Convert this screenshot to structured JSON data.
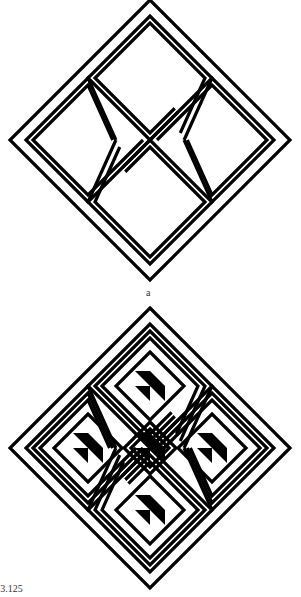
{
  "figure": {
    "panel_a_label": "a",
    "caption": "re 3.125",
    "panels": [
      {
        "id": "a",
        "motif": "diamond-with-four-hooked-arms",
        "arm_ring_count": 2,
        "inner_triangles": false
      },
      {
        "id": "b",
        "motif": "diamond-with-five-nested-diamonds",
        "arm_ring_count": 3,
        "inner_triangles": true,
        "inner_triangle_count": 5
      }
    ],
    "colors": {
      "ink": "#000000",
      "paper": "#ffffff"
    }
  }
}
